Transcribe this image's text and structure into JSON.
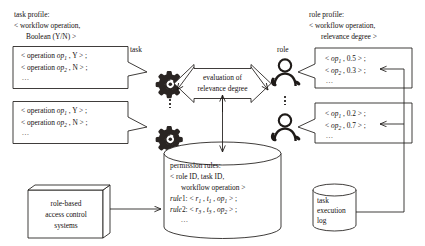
{
  "diagram": {
    "title_task_profile": "task profile:",
    "task_profile_line2": "< workflow operation,",
    "task_profile_line3": "Boolean (Y/N) >",
    "title_role_profile": "role profile:",
    "role_profile_line2": "< workflow operation,",
    "role_profile_line3": "relevance degree >",
    "task_label": "task",
    "role_label": "role",
    "ellipsis": "...",
    "task_boxes": [
      {
        "name": "task-profile-box-1",
        "line1_pre": "< operation ",
        "line1_op": "op",
        "line1_sub": "1",
        "line1_post": " , Y > ;",
        "line2_pre": "< operation ",
        "line2_op": "op",
        "line2_sub": "2",
        "line2_post": " , N > ;",
        "line3": "..."
      },
      {
        "name": "task-profile-box-2",
        "line1_pre": "< operation ",
        "line1_op": "op",
        "line1_sub": "1",
        "line1_post": " , Y > ;",
        "line2_pre": "< operation ",
        "line2_op": "op",
        "line2_sub": "2",
        "line2_post": " , N > ;",
        "line3": "..."
      }
    ],
    "role_boxes": [
      {
        "name": "role-profile-box-1",
        "line1_pre": "< ",
        "line1_op": "op",
        "line1_sub": "1",
        "line1_post": " , 0.5 > ;",
        "line2_pre": "< ",
        "line2_op": "op",
        "line2_sub": "2",
        "line2_post": " , 0.3 > ;",
        "line3": "..."
      },
      {
        "name": "role-profile-box-2",
        "line1_pre": "< ",
        "line1_op": "op",
        "line1_sub": "1",
        "line1_post": " , 0.2 > ;",
        "line2_pre": "< ",
        "line2_op": "op",
        "line2_sub": "2",
        "line2_post": " , 0.7 > ;",
        "line3": "..."
      }
    ],
    "evaluation": {
      "line1": "evaluation of",
      "line2": "relevance degree"
    },
    "permission_rules": {
      "line1": "permission rules:",
      "line2": "< role ID, task ID,",
      "line3": "workflow operation >",
      "rule1_label": "rule",
      "rule1_num": "1: < ",
      "rule1_r": "r",
      "rule1_r_sub": "1",
      "rule1_mid1": " , ",
      "rule1_t": "t",
      "rule1_t_sub": "1",
      "rule1_mid2": " , ",
      "rule1_op": "op",
      "rule1_op_sub": "1",
      "rule1_end": " > ;",
      "rule2_label": "rule",
      "rule2_num": "2: < ",
      "rule2_r": "r",
      "rule2_r_sub": "3",
      "rule2_mid1": " , ",
      "rule2_t": "t",
      "rule2_t_sub": "3",
      "rule2_mid2": " , ",
      "rule2_op": "op",
      "rule2_op_sub": "2",
      "rule2_end": " > ;",
      "line6": "..."
    },
    "rbac_box": {
      "line1": "role-based",
      "line2": "access control",
      "line3": "systems"
    },
    "task_log": {
      "line1": "task",
      "line2": "execution",
      "line3": "log"
    },
    "colors": {
      "ink": "#1e1a18",
      "paper": "#ffffff"
    }
  }
}
